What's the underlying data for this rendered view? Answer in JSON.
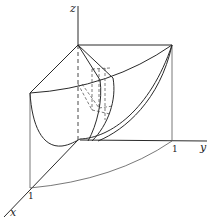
{
  "figure": {
    "type": "3d-surface-diagram",
    "axes": {
      "x_label": "x",
      "y_label": "y",
      "z_label": "z"
    },
    "tick_labels": {
      "x_one": "1",
      "y_one": "1"
    },
    "colors": {
      "line": "#2a2a2a",
      "background": "#ffffff"
    }
  }
}
